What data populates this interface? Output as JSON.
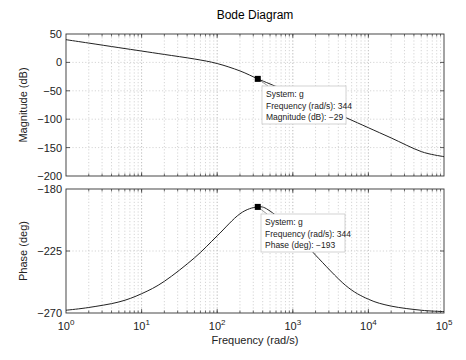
{
  "chart_data": [
    {
      "type": "line",
      "title": "Bode Diagram",
      "panel": "magnitude",
      "xlabel": "Frequency (rad/s)",
      "ylabel": "Magnitude (dB)",
      "xscale": "log",
      "xlim": [
        1,
        100000
      ],
      "ylim": [
        -200,
        50
      ],
      "yticks": [
        50,
        0,
        -50,
        -100,
        -150,
        -200
      ],
      "ytick_labels": [
        "50",
        "0",
        "−50",
        "−100",
        "−150",
        "−200"
      ],
      "grid": true,
      "series": [
        {
          "name": "g",
          "x": [
            1,
            2,
            5,
            10,
            20,
            50,
            100,
            200,
            344,
            500,
            1000,
            2000,
            5000,
            10000,
            20000,
            50000,
            100000
          ],
          "values": [
            40,
            34,
            26,
            20,
            14,
            6,
            -2,
            -15,
            -29,
            -38,
            -55,
            -73,
            -97,
            -115,
            -133,
            -157,
            -166
          ]
        }
      ],
      "datatip": {
        "x": 344,
        "y": -29,
        "lines": [
          "System: g",
          "Frequency (rad/s): 344",
          "Magnitude (dB): −29"
        ]
      }
    },
    {
      "type": "line",
      "panel": "phase",
      "xlabel": "Frequency (rad/s)",
      "ylabel": "Phase (deg)",
      "xscale": "log",
      "xlim": [
        1,
        100000
      ],
      "ylim": [
        -270,
        -180
      ],
      "yticks": [
        -180,
        -225,
        -270
      ],
      "ytick_labels": [
        "−180",
        "−225",
        "−270"
      ],
      "xticks": [
        1,
        10,
        100,
        1000,
        10000,
        100000
      ],
      "xtick_labels": [
        [
          "10",
          "0"
        ],
        [
          "10",
          "1"
        ],
        [
          "10",
          "2"
        ],
        [
          "10",
          "3"
        ],
        [
          "10",
          "4"
        ],
        [
          "10",
          "5"
        ]
      ],
      "grid": true,
      "series": [
        {
          "name": "g",
          "x": [
            1,
            2,
            5,
            10,
            20,
            50,
            100,
            200,
            344,
            500,
            1000,
            2000,
            5000,
            10000,
            20000,
            50000,
            100000
          ],
          "values": [
            -268,
            -266,
            -262,
            -256,
            -247,
            -230,
            -214,
            -198,
            -193,
            -196,
            -210,
            -228,
            -250,
            -260,
            -265,
            -268,
            -269
          ]
        }
      ],
      "datatip": {
        "x": 344,
        "y": -193,
        "lines": [
          "System: g",
          "Frequency (rad/s): 344",
          "Phase (deg): −193"
        ]
      }
    }
  ],
  "labels": {
    "title": "Bode Diagram",
    "mag_ylabel": "Magnitude (dB)",
    "phase_ylabel": "Phase (deg)",
    "xlabel": "Frequency (rad/s)"
  },
  "style": {
    "curve_color": "#222222",
    "grid_color": "#b8b8b8",
    "axis_color": "#333333",
    "tip_bg": "#ffffff",
    "tip_border": "#c8c8c8"
  }
}
